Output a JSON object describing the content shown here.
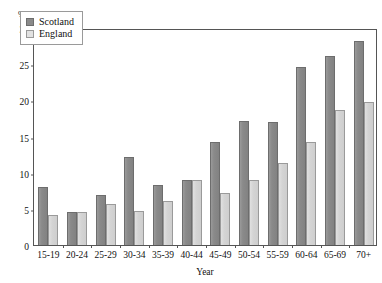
{
  "chart_data": {
    "type": "bar",
    "title": "",
    "subtitle": "",
    "xlabel": "Year",
    "ylabel": "%",
    "ylim": [
      0,
      30
    ],
    "yticks": [
      0,
      5,
      10,
      15,
      20,
      25,
      30
    ],
    "grid": false,
    "legend_position": "top-left",
    "categories": [
      "15-19",
      "20-24",
      "25-29",
      "30-34",
      "35-39",
      "40-44",
      "45-49",
      "50-54",
      "55-59",
      "60-64",
      "65-69",
      "70+"
    ],
    "series": [
      {
        "name": "Scotland",
        "color": "#8a8a8a",
        "values": [
          8.0,
          4.6,
          6.9,
          12.2,
          8.3,
          9.0,
          14.3,
          17.1,
          17.0,
          24.6,
          26.2,
          28.2
        ]
      },
      {
        "name": "England",
        "color": "#d4d4d4",
        "values": [
          4.1,
          4.6,
          5.7,
          4.7,
          6.1,
          9.0,
          7.2,
          9.0,
          11.3,
          14.3,
          18.7,
          19.8
        ]
      }
    ]
  },
  "legend": {
    "entries": [
      {
        "label": "Scotland",
        "swatch": "scotland"
      },
      {
        "label": "England",
        "swatch": "england"
      }
    ]
  },
  "axes": {
    "y_unit_label": "%",
    "x_axis_title": "Year"
  }
}
